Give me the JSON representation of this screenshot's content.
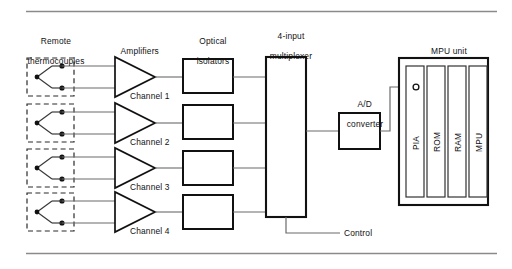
{
  "figure": {
    "rules": {
      "top_y": 11,
      "bottom_y": 253,
      "color": "#808080"
    },
    "background": "#ffffff",
    "line_color": "#1a1a1a",
    "signal_line_color": "#6b6b6b"
  },
  "column_headings": {
    "thermocouples_line1": "Remote",
    "thermocouples_line2": "thermocouples",
    "amplifiers": "Amplifiers",
    "isolators_line1": "Optical",
    "isolators_line2": "isolators",
    "multiplexer_line1": "4-input",
    "multiplexer_line2": "multiplexer",
    "adc_line1": "A/D",
    "adc_line2": "converter",
    "mpu_unit": "MPU unit"
  },
  "channels": [
    {
      "label": "Channel 1",
      "row_y": 77
    },
    {
      "label": "Channel 2",
      "row_y": 123
    },
    {
      "label": "Channel 3",
      "row_y": 168
    },
    {
      "label": "Channel 4",
      "row_y": 212
    }
  ],
  "mpu_blocks": [
    {
      "label": "PIA"
    },
    {
      "label": "ROM"
    },
    {
      "label": "RAM"
    },
    {
      "label": "MPU"
    }
  ],
  "control": {
    "label": "Control"
  },
  "components": {
    "thermocouple_name": "thermocouple sensor (dashed enclosure, junction)",
    "amplifier_name": "operational amplifier triangle",
    "isolator_name": "optical isolator block",
    "multiplexer_name": "4-input multiplexer block",
    "adc_name": "analog to digital converter block",
    "mpu_name": "microprocessor unit enclosure"
  }
}
